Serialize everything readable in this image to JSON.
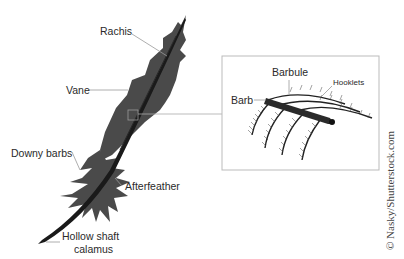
{
  "diagram": {
    "labels": {
      "rachis": "Rachis",
      "vane": "Vane",
      "downy_barbs": "Downy barbs",
      "afterfeather": "Afterfeather",
      "hollow_shaft": "Hollow shaft",
      "calamus": "calamus"
    },
    "inset": {
      "labels": {
        "barb": "Barb",
        "barbule": "Barbule",
        "hooklets": "Hooklets"
      }
    },
    "colors": {
      "feather": "#4a4a4a",
      "shaft": "#1a1a1a",
      "leader_line": "#999999",
      "inset_border": "#bbbbbb",
      "text": "#2a2a2a"
    }
  },
  "watermark": "© Nasky/Shutterstock.com"
}
